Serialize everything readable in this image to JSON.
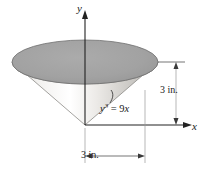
{
  "figure": {
    "background_color": "#ffffff",
    "axes": {
      "y_label": "y",
      "x_label": "x",
      "line_color": "#222222"
    },
    "solid": {
      "name": "cone",
      "orientation": "apex-down",
      "top_face_color": "#a0a0a0",
      "top_face_edge_color": "#6e6e6e",
      "lateral_light_color": "#f0efed",
      "lateral_mid_color": "#cfcdca",
      "lateral_dark_color": "#9b9995",
      "outline_color": "#8c8a86"
    },
    "dimensions": [
      {
        "name": "height",
        "orientation": "vertical",
        "label": "3 in.",
        "line_color": "#3a3a3a"
      },
      {
        "name": "radius",
        "orientation": "horizontal",
        "label": "3 in.",
        "line_color": "#3a3a3a"
      }
    ],
    "annotations": [
      {
        "name": "curve-equation",
        "variable": "y",
        "exponent": "3",
        "equals": " = 9",
        "rhs_variable": "x",
        "full_text": "y3 = 9x"
      }
    ]
  }
}
